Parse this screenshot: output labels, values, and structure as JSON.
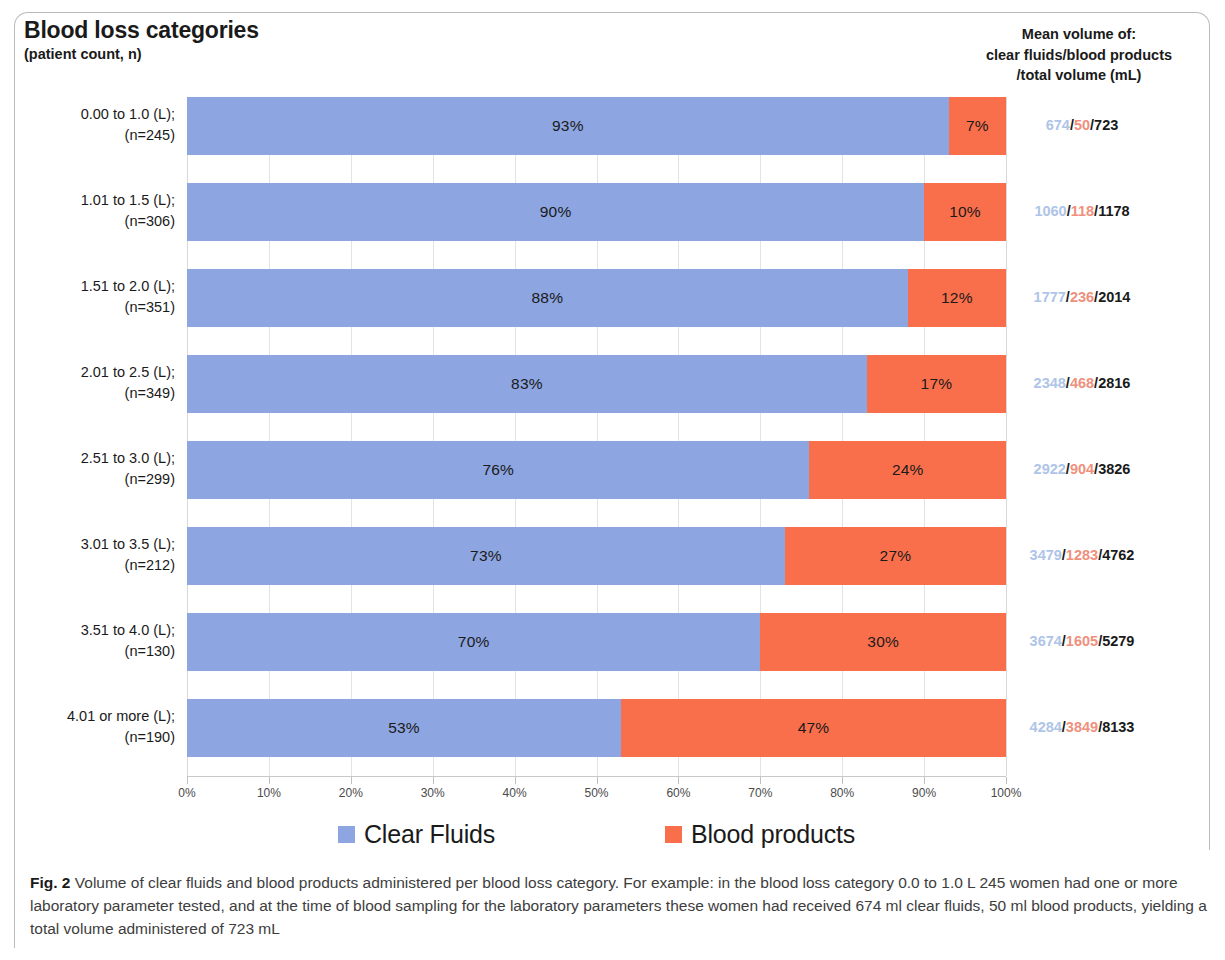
{
  "figure": {
    "title": "Blood loss categories",
    "subtitle": "(patient count, n)",
    "right_header_line1": "Mean volume of:",
    "right_header_line2": "clear fluids/blood products",
    "right_header_line3": "/total volume (mL)",
    "caption_label": "Fig. 2",
    "caption_text": " Volume of clear fluids and blood products administered per blood loss category. For example: in the blood loss category 0.0 to 1.0 L 245 women had one or more laboratory parameter tested, and at the time of blood sampling for the laboratory parameters these women had received 674 ml clear fluids, 50 ml blood products, yielding a total volume administered of 723 mL"
  },
  "colors": {
    "clear_fluids": "#8da5e0",
    "blood_products": "#f96f4c",
    "fluid_value_text": "#aec4e8",
    "blood_value_text": "#f0907c",
    "total_value_text": "#1a1a1a",
    "gridline": "#e3e3e3"
  },
  "legend": {
    "position": "bottom",
    "items": [
      {
        "label": "Clear Fluids",
        "color": "#8da5e0",
        "swatch": "clear-fluids-swatch"
      },
      {
        "label": "Blood products",
        "color": "#f96f4c",
        "swatch": "blood-products-swatch"
      }
    ]
  },
  "axis": {
    "ticks": [
      "0%",
      "10%",
      "20%",
      "30%",
      "40%",
      "50%",
      "60%",
      "70%",
      "80%",
      "90%",
      "100%"
    ],
    "tick_values": [
      0,
      10,
      20,
      30,
      40,
      50,
      60,
      70,
      80,
      90,
      100
    ]
  },
  "rows": [
    {
      "category": "0.00 to 1.0 (L);",
      "count": "(n=245)",
      "clear_pct_label": "93%",
      "blood_pct_label": "7%",
      "clear_pct": 93,
      "blood_pct": 7,
      "mean_fluid": "674",
      "mean_blood": "50",
      "mean_total": "723"
    },
    {
      "category": "1.01 to 1.5 (L);",
      "count": "(n=306)",
      "clear_pct_label": "90%",
      "blood_pct_label": "10%",
      "clear_pct": 90,
      "blood_pct": 10,
      "mean_fluid": "1060",
      "mean_blood": "118",
      "mean_total": "1178"
    },
    {
      "category": "1.51 to 2.0 (L);",
      "count": "(n=351)",
      "clear_pct_label": "88%",
      "blood_pct_label": "12%",
      "clear_pct": 88,
      "blood_pct": 12,
      "mean_fluid": "1777",
      "mean_blood": "236",
      "mean_total": "2014"
    },
    {
      "category": "2.01 to 2.5 (L);",
      "count": "(n=349)",
      "clear_pct_label": "83%",
      "blood_pct_label": "17%",
      "clear_pct": 83,
      "blood_pct": 17,
      "mean_fluid": "2348",
      "mean_blood": "468",
      "mean_total": "2816"
    },
    {
      "category": "2.51 to 3.0 (L);",
      "count": "(n=299)",
      "clear_pct_label": "76%",
      "blood_pct_label": "24%",
      "clear_pct": 76,
      "blood_pct": 24,
      "mean_fluid": "2922",
      "mean_blood": "904",
      "mean_total": "3826"
    },
    {
      "category": "3.01 to 3.5 (L);",
      "count": "(n=212)",
      "clear_pct_label": "73%",
      "blood_pct_label": "27%",
      "clear_pct": 73,
      "blood_pct": 27,
      "mean_fluid": "3479",
      "mean_blood": "1283",
      "mean_total": "4762"
    },
    {
      "category": "3.51 to 4.0 (L);",
      "count": "(n=130)",
      "clear_pct_label": "70%",
      "blood_pct_label": "30%",
      "clear_pct": 70,
      "blood_pct": 30,
      "mean_fluid": "3674",
      "mean_blood": "1605",
      "mean_total": "5279"
    },
    {
      "category": "4.01 or more (L);",
      "count": "(n=190)",
      "clear_pct_label": "53%",
      "blood_pct_label": "47%",
      "clear_pct": 53,
      "blood_pct": 47,
      "mean_fluid": "4284",
      "mean_blood": "3849",
      "mean_total": "8133"
    }
  ],
  "chart_data": {
    "type": "bar",
    "orientation": "horizontal",
    "stacked": true,
    "normalized": true,
    "title": "Blood loss categories",
    "subtitle": "(patient count, n)",
    "xlabel": "",
    "ylabel": "Blood loss categories (patient count, n)",
    "xlim": [
      0,
      100
    ],
    "xtick_labels": [
      "0%",
      "10%",
      "20%",
      "30%",
      "40%",
      "50%",
      "60%",
      "70%",
      "80%",
      "90%",
      "100%"
    ],
    "grid": true,
    "legend_position": "bottom",
    "categories": [
      "0.00 to 1.0 (L); (n=245)",
      "1.01 to 1.5 (L); (n=306)",
      "1.51 to 2.0 (L); (n=351)",
      "2.01 to 2.5 (L); (n=349)",
      "2.51 to 3.0 (L); (n=299)",
      "3.01 to 3.5 (L); (n=212)",
      "3.51 to 4.0 (L); (n=130)",
      "4.01 or more (L); (n=190)"
    ],
    "series": [
      {
        "name": "Clear Fluids",
        "color": "#8da5e0",
        "values": [
          93,
          90,
          88,
          83,
          76,
          73,
          70,
          53
        ]
      },
      {
        "name": "Blood products",
        "color": "#f96f4c",
        "values": [
          7,
          10,
          12,
          17,
          24,
          27,
          30,
          47
        ]
      }
    ],
    "annotations": {
      "mean_clear_fluids_ml": [
        674,
        1060,
        1777,
        2348,
        2922,
        3479,
        3674,
        4284
      ],
      "mean_blood_products_ml": [
        50,
        118,
        236,
        468,
        904,
        1283,
        1605,
        3849
      ],
      "mean_total_volume_ml": [
        723,
        1178,
        2014,
        2816,
        3826,
        4762,
        5279,
        8133
      ],
      "patient_counts": [
        245,
        306,
        351,
        349,
        299,
        212,
        130,
        190
      ]
    }
  }
}
